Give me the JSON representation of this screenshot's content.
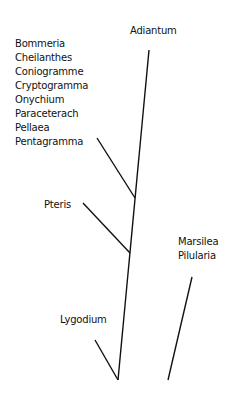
{
  "diagram": {
    "type": "phylogenetic-tree",
    "labels": {
      "adiantum": "Adiantum",
      "pteris": "Pteris",
      "lygodium": "Lygodium",
      "marsilea_group": [
        "Marsilea",
        "Pilularia"
      ],
      "pteridoid_group": [
        "Bommeria",
        "Cheilanthes",
        "Coniogramme",
        "Cryptogramma",
        "Onychium",
        "Paraceterach",
        "Pellaea",
        "Pentagramma"
      ]
    },
    "line_color": "#111111"
  }
}
